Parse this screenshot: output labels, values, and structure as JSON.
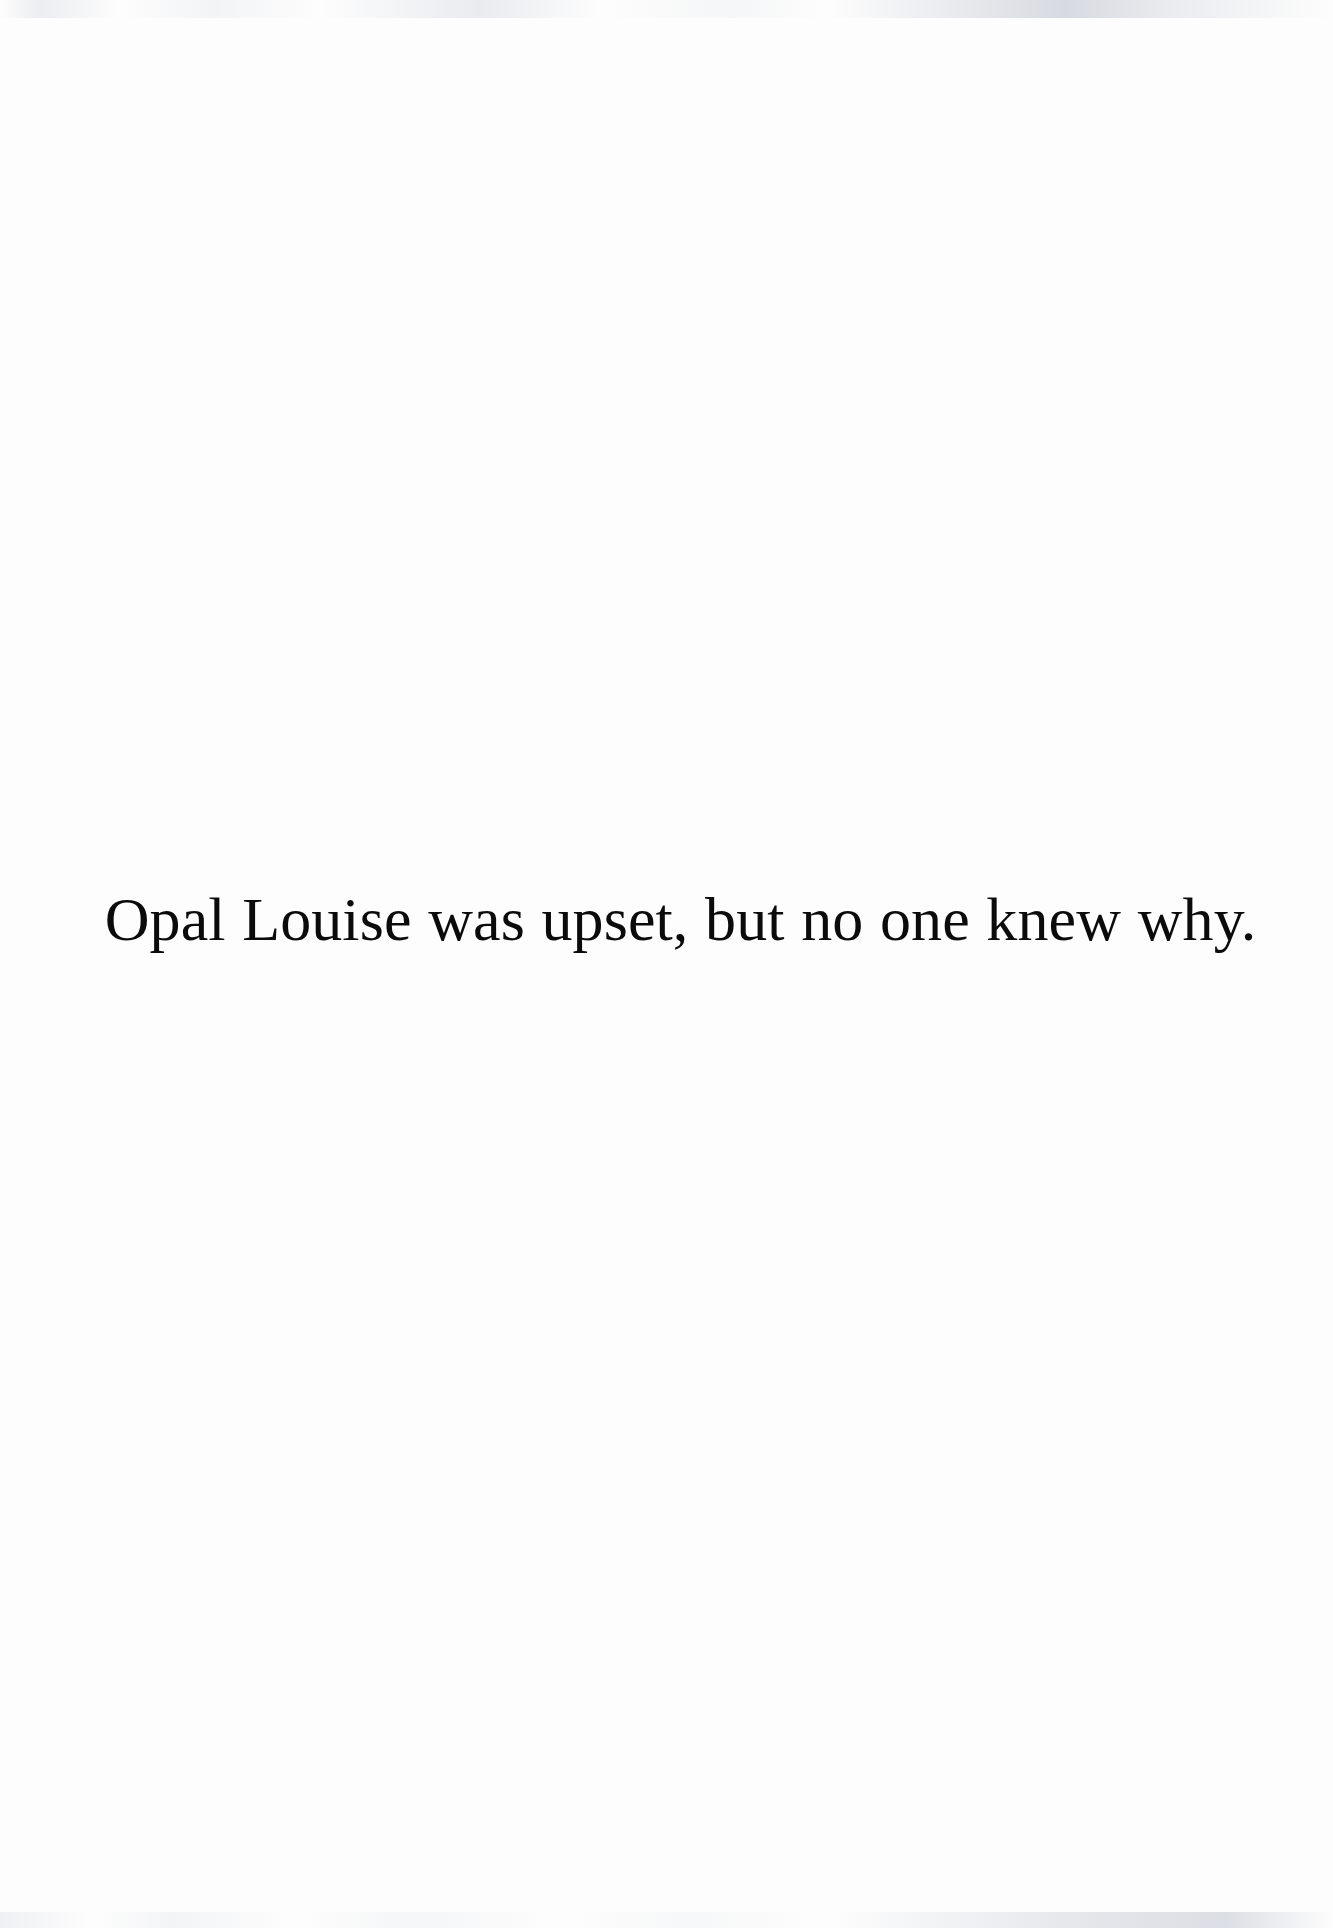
{
  "page": {
    "kind": "picture-book-text-page",
    "background_color": "#fdfdfd",
    "text_color": "#0b0b0c"
  },
  "body": {
    "lines": [
      "Opal Louise was upset, but no one knew why."
    ],
    "full_text": "Opal Louise was upset, but no one knew why.",
    "alignment": "center"
  }
}
